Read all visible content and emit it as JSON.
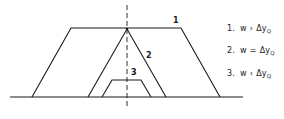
{
  "diagram": {
    "colors": {
      "line": "#1a1a1a",
      "background": "#ffffff"
    },
    "baseline": {
      "x1": 10,
      "x2": 243,
      "y": 97
    },
    "axis": {
      "x": 127,
      "y1": 5,
      "y2": 109,
      "dash": "5,3"
    },
    "shapes": [
      {
        "id": "1",
        "label": "1",
        "kind": "trapezoid",
        "points": "32,97 71,28 181,28 220,97",
        "label_pos": {
          "x": 173,
          "y": 16
        }
      },
      {
        "id": "2",
        "label": "2",
        "kind": "triangle",
        "points": "88,97 127,29 166,97",
        "label_pos": {
          "x": 146,
          "y": 51
        }
      },
      {
        "id": "3",
        "label": "3",
        "kind": "trapezoid",
        "points": "102,97 112,80 141,80 151,97",
        "label_pos": {
          "x": 131,
          "y": 68
        }
      }
    ]
  },
  "legend": {
    "items": [
      {
        "num": "1.",
        "var": "w",
        "op": "›",
        "rhs": "Δy",
        "sub": "Q",
        "meaning": "w > Δy_Q"
      },
      {
        "num": "2.",
        "var": "w",
        "op": "=",
        "rhs": "Δy",
        "sub": "Q",
        "meaning": "w = Δy_Q"
      },
      {
        "num": "3.",
        "var": "w",
        "op": "‹",
        "rhs": "Δy",
        "sub": "Q",
        "meaning": "w < Δy_Q"
      }
    ]
  }
}
